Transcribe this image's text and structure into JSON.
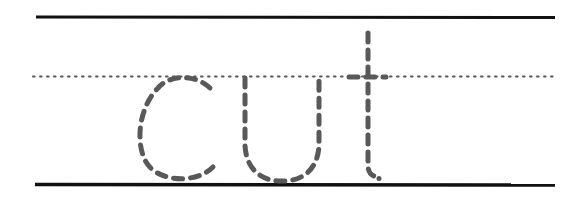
{
  "worksheet": {
    "word": "cut",
    "letters": [
      "c",
      "u",
      "t"
    ],
    "style": "dashed tracing letters on handwriting guide lines"
  },
  "colors": {
    "guide_line": "#111111",
    "midline_dots": "#555555",
    "trace_letters": "#595959",
    "background": "#ffffff"
  }
}
